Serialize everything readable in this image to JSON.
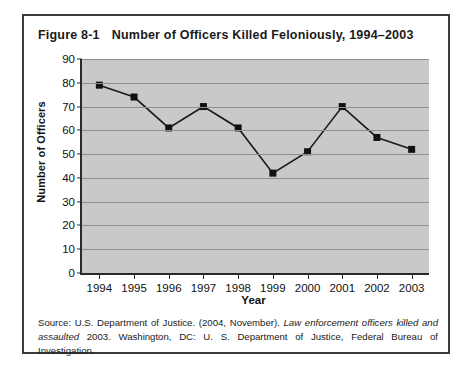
{
  "figure": {
    "number": "Figure 8-1",
    "title": "Number of Officers Killed Feloniously, 1994–2003",
    "source_prefix": "Source: U.S. Department of Justice. (2004, November). ",
    "source_italic": "Law enforcement officers killed and assaulted",
    "source_suffix": " 2003. Washington, DC: U. S. Department of Justice, Federal Bureau of Investigation."
  },
  "colors": {
    "plot_background": "#c9c9c9",
    "gridline": "#8e8e8e",
    "axis": "#2b2b2b",
    "series_line": "#1a1a1a",
    "marker": "#111111",
    "frame_border": "#3a3a3a",
    "page_background": "#ffffff"
  },
  "chart_data": {
    "type": "line",
    "title": "Number of Officers Killed Feloniously, 1994–2003",
    "xlabel": "Year",
    "ylabel": "Number of Officers",
    "categories": [
      "1994",
      "1995",
      "1996",
      "1997",
      "1998",
      "1999",
      "2000",
      "2001",
      "2002",
      "2003"
    ],
    "values": [
      79,
      74,
      61,
      70,
      61,
      42,
      51,
      70,
      57,
      52
    ],
    "ylim": [
      0,
      90
    ],
    "ytick_labels": [
      "90",
      "80",
      "70",
      "60",
      "50",
      "40",
      "30",
      "20",
      "10",
      "0"
    ],
    "ytick_values": [
      90,
      80,
      70,
      60,
      50,
      40,
      30,
      20,
      10,
      0
    ],
    "ytick_step": 10,
    "grid": true,
    "legend": false,
    "marker": "square",
    "series": [
      {
        "name": "Officers killed feloniously",
        "values": [
          79,
          74,
          61,
          70,
          61,
          42,
          51,
          70,
          57,
          52
        ]
      }
    ]
  }
}
